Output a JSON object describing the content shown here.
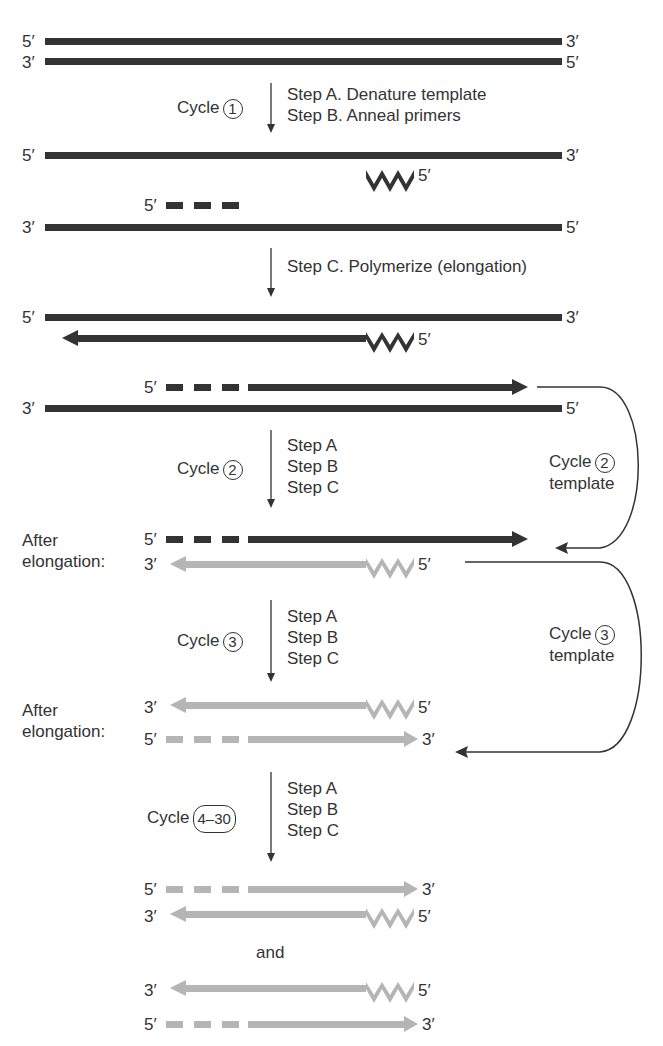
{
  "diagram": {
    "colors": {
      "dark_strand": "#333333",
      "light_strand": "#b5b5b5",
      "text": "#333333"
    },
    "end_labels": {
      "five_prime": "5′",
      "three_prime": "3′"
    },
    "cycle_prefix": "Cycle",
    "cycle1": {
      "number": "1",
      "steps": [
        "Step A.  Denature template",
        "Step B.  Anneal primers"
      ]
    },
    "cycle1_stepC": "Step C.  Polymerize (elongation)",
    "cycle2": {
      "number": "2",
      "steps": [
        "Step A",
        "Step B",
        "Step C"
      ]
    },
    "cycle3": {
      "number": "3",
      "steps": [
        "Step A",
        "Step B",
        "Step C"
      ]
    },
    "cycle4": {
      "number": "4–30",
      "steps": [
        "Step A",
        "Step B",
        "Step C"
      ]
    },
    "after_elongation": "After\nelongation:",
    "after_label_line1": "After",
    "after_label_line2": "elongation:",
    "template2": {
      "number": "2",
      "word": "template"
    },
    "template3": {
      "number": "3",
      "word": "template"
    },
    "and_label": "and"
  }
}
